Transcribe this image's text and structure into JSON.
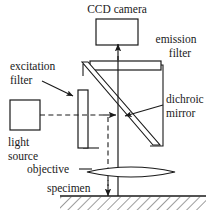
{
  "figure": {
    "type": "schematic-diagram",
    "background_color": "#ffffff",
    "line_color": "#1a1a1a",
    "hatch_color": "#4a4a4a"
  },
  "labels": {
    "ccd_camera": "CCD camera",
    "emission_filter_line1": "emission",
    "emission_filter_line2": "filter",
    "excitation_filter_line1": "excitation",
    "excitation_filter_line2": "filter",
    "dichroic_mirror_line1": "dichroic",
    "dichroic_mirror_line2": "mirror",
    "light_source_line1": "light",
    "light_source_line2": "source",
    "objective": "objective",
    "specimen": "specimen"
  },
  "components": {
    "ccd_camera": {
      "name": "ccd-camera",
      "shape": "rectangle"
    },
    "emission_filter": {
      "name": "emission-filter",
      "shape": "horizontal-bar"
    },
    "excitation_filter": {
      "name": "excitation-filter",
      "shape": "vertical-bar"
    },
    "dichroic_mirror": {
      "name": "dichroic-mirror",
      "shape": "diagonal-slab"
    },
    "light_source": {
      "name": "light-source",
      "shape": "rectangle"
    },
    "objective": {
      "name": "objective-lens",
      "shape": "lens-ellipse"
    },
    "specimen": {
      "name": "specimen",
      "shape": "hatched-slab"
    },
    "filter_cube": {
      "name": "filter-cube",
      "shape": "open-rectangle"
    }
  },
  "light_paths": {
    "excitation": {
      "name": "excitation-beam",
      "style": "dashed",
      "direction": "light source to dichroic mirror to specimen"
    },
    "emission": {
      "name": "emission-beam",
      "style": "solid",
      "direction": "specimen to dichroic mirror to emission filter to CCD camera"
    }
  }
}
